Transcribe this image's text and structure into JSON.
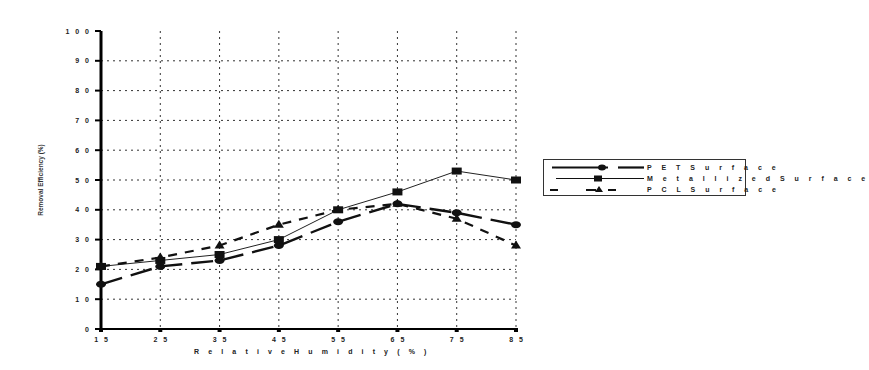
{
  "chart_data": {
    "type": "line",
    "title": "",
    "xlabel": "Relative Humidity (%)",
    "ylabel": "Removal Efficiency (%)",
    "x": [
      15,
      25,
      35,
      45,
      55,
      65,
      75,
      85
    ],
    "x_tick_labels": [
      "1 5",
      "2 5",
      "3 5",
      "4 5",
      "5 5",
      "6 5",
      "7 5",
      "8 5"
    ],
    "y_tick_labels": [
      "0",
      "1 0",
      "2 0",
      "3 0",
      "4 0",
      "5 0",
      "6 0",
      "7 0",
      "8 0",
      "9 0",
      "1 0 0"
    ],
    "xlim": [
      15,
      85
    ],
    "ylim": [
      0,
      100
    ],
    "grid": "dotted",
    "legend_position": "right",
    "series": [
      {
        "name": "PET Surface",
        "marker": "circle",
        "line": "long-dash",
        "values": [
          15,
          21,
          23,
          28,
          36,
          42,
          39,
          35
        ]
      },
      {
        "name": "Metallized Surface",
        "marker": "square",
        "line": "thin-solid",
        "values": [
          21,
          23,
          25,
          30,
          40,
          46,
          53,
          50
        ]
      },
      {
        "name": "PCL Surface",
        "marker": "triangle",
        "line": "short-dash",
        "values": [
          21,
          24,
          28,
          35,
          40,
          42,
          37,
          28
        ]
      }
    ]
  },
  "axis": {
    "x_title": "R e l a t i v e  H u m  i d i t y  ( %  )",
    "y_title": "Removal Efficiency (%)"
  },
  "legend": {
    "items": [
      {
        "label": "P E T  S u r f a c e"
      },
      {
        "label": "M e t a l l i z e d  S u r f a c e"
      },
      {
        "label": "P C L  S u r f a c e"
      }
    ]
  }
}
